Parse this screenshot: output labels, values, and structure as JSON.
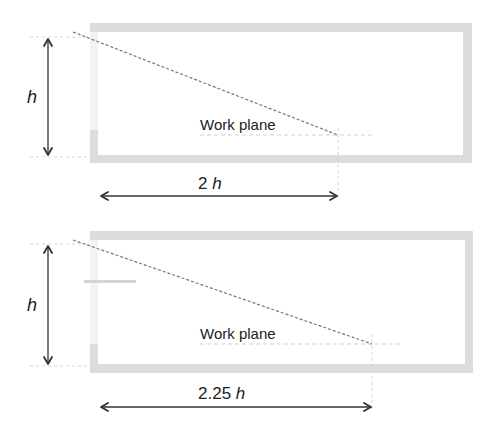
{
  "colors": {
    "wall": "#dcdcdc",
    "wall_faint": "#ececec",
    "line": "#333333",
    "dashed": "#777777",
    "guide": "#cfcfcf",
    "text": "#222222"
  },
  "diagrams": [
    {
      "id": "diagram-top",
      "height_label": "h",
      "width_label": "2 h",
      "work_plane_label": "Work plane",
      "ratio": "2h"
    },
    {
      "id": "diagram-bottom",
      "height_label": "h",
      "width_label": "2.25 h",
      "work_plane_label": "Work plane",
      "ratio": "2.25h"
    }
  ]
}
